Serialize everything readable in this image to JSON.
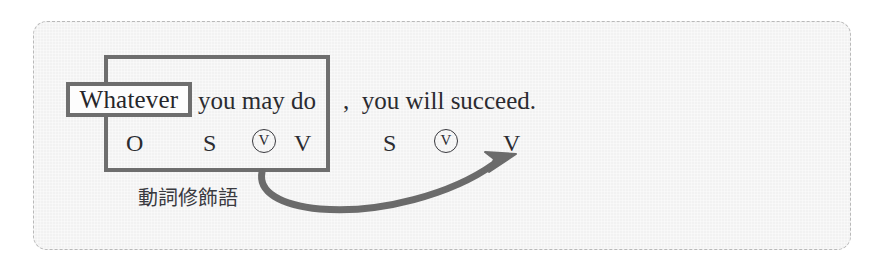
{
  "panel": {
    "background_color": "#f2f2f2",
    "border_color": "#b9b9b9",
    "border_style": "dashed-rounded"
  },
  "sentence": {
    "highlighted_word": "Whatever",
    "middle": "you may do",
    "tail": ",  you will succeed."
  },
  "roles": {
    "clause": {
      "object": "O",
      "subject": "S",
      "aux_circled": "V",
      "verb": "V"
    },
    "main": {
      "subject": "S",
      "aux_circled": "V",
      "verb": "V"
    }
  },
  "annotation": {
    "japanese_label": "動詞修飾語"
  },
  "shapes": {
    "clause_box_color": "#6e6e6e",
    "word_box_color": "#6e6e6e",
    "word_box_fill": "#fdfdfd",
    "arrow_color": "#6b6b6b",
    "arrow_description": "curved arrow from clause box bottom to main-clause verb"
  }
}
